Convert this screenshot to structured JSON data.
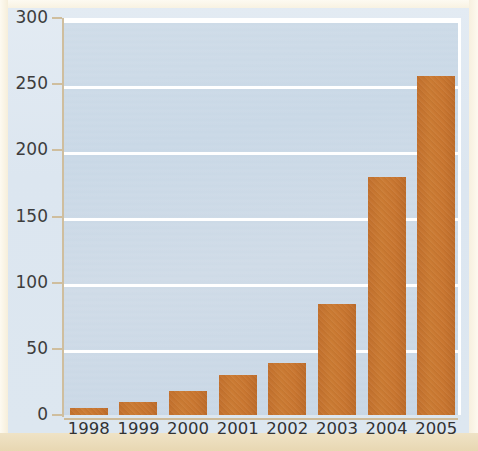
{
  "chart_data": {
    "type": "bar",
    "title": "",
    "subtitle": "",
    "xlabel": "",
    "ylabel": "",
    "categories": [
      "1998",
      "1999",
      "2000",
      "2001",
      "2002",
      "2003",
      "2004",
      "2005"
    ],
    "values": [
      5,
      10,
      18,
      30,
      39,
      84,
      180,
      256
    ],
    "series": [
      {
        "name": "",
        "values": [
          5,
          10,
          18,
          30,
          39,
          84,
          180,
          256
        ]
      }
    ],
    "ylim": [
      0,
      300
    ],
    "yticks": [
      0,
      50,
      100,
      150,
      200,
      250,
      300
    ],
    "ytick_labels": [
      "0",
      "50",
      "100",
      "150",
      "200",
      "250",
      "300"
    ],
    "xtick_labels": [
      "1998",
      "1999",
      "2000",
      "2001",
      "2002",
      "2003",
      "2004",
      "2005"
    ],
    "grid": true,
    "grid_axis": "y",
    "legend": false,
    "legend_position": "none",
    "annotations": []
  },
  "style": {
    "bar_color": "#c8762f",
    "plot_background": "#cbd9e6",
    "gridline_color": "#ffffff",
    "axis_color": "#cfbe9e",
    "tick_label_color": "#333333",
    "page_background": "#f5eeda",
    "card_background": "#dde7f0"
  }
}
